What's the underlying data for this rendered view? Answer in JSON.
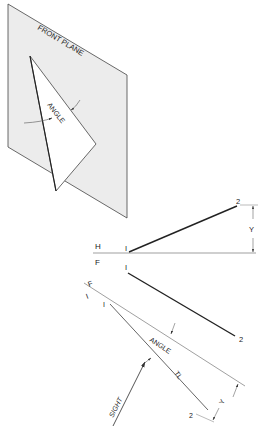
{
  "figure": {
    "pictorial": {
      "plane_label": "FRONT PLANE",
      "angle_label": "ANGLE",
      "plane_fill": "#ececec",
      "line_color": "#333333"
    },
    "orthographic": {
      "fold_line_labels": {
        "upper": "H",
        "lower": "F"
      },
      "top_view": {
        "point_1": "I",
        "point_2": "2",
        "dimension": "Y"
      },
      "front_view": {
        "point_1": "I",
        "point_2": "2"
      }
    },
    "auxiliary": {
      "fold_line_labels": {
        "upper": "F",
        "lower": "I"
      },
      "point_1": "I",
      "point_2": "2",
      "angle_label": "ANGLE",
      "true_length_label": "TL",
      "dimension": "Y",
      "sight_label": "SIGHT"
    }
  }
}
